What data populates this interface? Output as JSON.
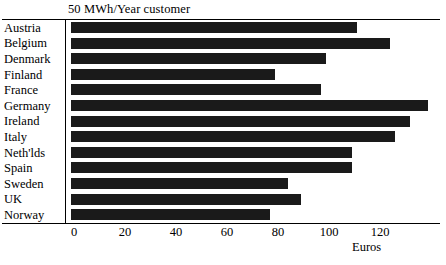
{
  "chart_data": {
    "type": "bar",
    "orientation": "horizontal",
    "title": "50 MWh/Year customer",
    "xlabel": "Euros",
    "ylabel": "",
    "categories": [
      "Austria",
      "Belgium",
      "Denmark",
      "Finland",
      "France",
      "Germany",
      "Ireland",
      "Italy",
      "Neth'lds",
      "Spain",
      "Sweden",
      "UK",
      "Norway"
    ],
    "values": [
      112,
      125,
      100,
      80,
      98,
      140,
      133,
      127,
      110,
      110,
      85,
      90,
      78
    ],
    "xticks": [
      0,
      20,
      40,
      60,
      80,
      100,
      120
    ],
    "xlim": [
      0,
      145
    ],
    "grid": false,
    "legend": false,
    "bar_color": "#1a1a1a"
  },
  "figure": {
    "title": "50 MWh/Year customer",
    "axis_title": "Euros"
  }
}
